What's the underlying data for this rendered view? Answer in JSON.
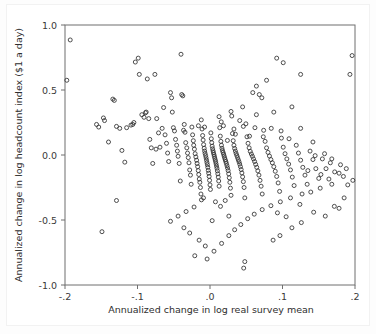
{
  "chart_data": {
    "type": "scatter",
    "title": "",
    "xlabel": "Annualized change in log real survey mean",
    "ylabel": "Annualized change in log headcount index ($1 a day)",
    "xlim": [
      -0.2,
      0.2
    ],
    "ylim": [
      -1.0,
      1.0
    ],
    "xticks": [
      -0.2,
      -0.1,
      0.0,
      0.1,
      0.2
    ],
    "xtick_labels": [
      "-.2",
      "-.1",
      ".0",
      ".1",
      ".2"
    ],
    "yticks": [
      -1.0,
      -0.5,
      0.0,
      0.5,
      1.0
    ],
    "ytick_labels": [
      "-1.0",
      "-0.5",
      "0.0",
      "0.5",
      "1.0"
    ],
    "grid": false,
    "legend": null,
    "marker": "open-circle",
    "marker_color": "#303030",
    "n_points": 283,
    "relationship": "negative",
    "points": [
      [
        -0.1928,
        0.885
      ],
      [
        -0.1975,
        0.575
      ],
      [
        -0.1565,
        0.235
      ],
      [
        -0.1535,
        0.215
      ],
      [
        -0.147,
        0.285
      ],
      [
        -0.1455,
        0.265
      ],
      [
        -0.14,
        0.1
      ],
      [
        -0.134,
        0.43
      ],
      [
        -0.132,
        0.42
      ],
      [
        -0.129,
        0.22
      ],
      [
        -0.1245,
        0.205
      ],
      [
        -0.1215,
        0.035
      ],
      [
        -0.1175,
        -0.055
      ],
      [
        -0.115,
        0.21
      ],
      [
        -0.109,
        0.23
      ],
      [
        -0.1065,
        0.235
      ],
      [
        -0.105,
        0.25
      ],
      [
        -0.103,
        0.715
      ],
      [
        -0.099,
        0.745
      ],
      [
        -0.0975,
        0.62
      ],
      [
        -0.094,
        0.31
      ],
      [
        -0.091,
        0.29
      ],
      [
        -0.089,
        0.325
      ],
      [
        -0.088,
        0.33
      ],
      [
        -0.0865,
        0.585
      ],
      [
        -0.0845,
        0.28
      ],
      [
        -0.083,
        0.12
      ],
      [
        -0.081,
        0.055
      ],
      [
        -0.079,
        -0.065
      ],
      [
        -0.076,
        0.62
      ],
      [
        -0.0745,
        0.045
      ],
      [
        -0.0735,
        0.28
      ],
      [
        -0.071,
        0.17
      ],
      [
        -0.069,
        0.06
      ],
      [
        -0.066,
        0.205
      ],
      [
        -0.064,
        0.365
      ],
      [
        -0.062,
        0.155
      ],
      [
        -0.06,
        0.09
      ],
      [
        -0.0585,
        0.015
      ],
      [
        -0.057,
        -0.05
      ],
      [
        -0.0545,
        0.48
      ],
      [
        -0.053,
        0.44
      ],
      [
        -0.052,
        0.33
      ],
      [
        -0.0505,
        0.21
      ],
      [
        -0.049,
        0.185
      ],
      [
        -0.0475,
        0.12
      ],
      [
        -0.046,
        0.075
      ],
      [
        -0.045,
        0.03
      ],
      [
        -0.044,
        -0.01
      ],
      [
        -0.0425,
        -0.065
      ],
      [
        -0.041,
        -0.2
      ],
      [
        -0.04,
        0.775
      ],
      [
        -0.039,
        0.465
      ],
      [
        -0.0375,
        0.455
      ],
      [
        -0.0365,
        0.19
      ],
      [
        -0.0355,
        0.235
      ],
      [
        -0.0345,
        0.175
      ],
      [
        -0.0335,
        0.095
      ],
      [
        -0.032,
        0.055
      ],
      [
        -0.031,
        0.015
      ],
      [
        -0.03,
        -0.02
      ],
      [
        -0.029,
        -0.06
      ],
      [
        -0.028,
        -0.115
      ],
      [
        -0.027,
        -0.155
      ],
      [
        -0.026,
        -0.225
      ],
      [
        -0.025,
        0.215
      ],
      [
        -0.024,
        0.155
      ],
      [
        -0.023,
        0.11
      ],
      [
        -0.0225,
        0.075
      ],
      [
        -0.0215,
        0.045
      ],
      [
        -0.0205,
        0.01
      ],
      [
        -0.0195,
        -0.015
      ],
      [
        -0.0185,
        -0.04
      ],
      [
        -0.0178,
        -0.065
      ],
      [
        -0.017,
        -0.09
      ],
      [
        -0.0162,
        -0.12
      ],
      [
        -0.0155,
        -0.15
      ],
      [
        -0.0148,
        -0.185
      ],
      [
        -0.014,
        -0.21
      ],
      [
        -0.0132,
        -0.25
      ],
      [
        -0.0125,
        -0.3
      ],
      [
        -0.0118,
        -0.345
      ],
      [
        -0.011,
        0.2
      ],
      [
        -0.0102,
        0.15
      ],
      [
        -0.0095,
        0.115
      ],
      [
        -0.0088,
        0.08
      ],
      [
        -0.008,
        0.052
      ],
      [
        -0.0074,
        0.03
      ],
      [
        -0.0068,
        0.012
      ],
      [
        -0.006,
        -0.005
      ],
      [
        -0.0054,
        -0.022
      ],
      [
        -0.0048,
        -0.04
      ],
      [
        -0.0042,
        -0.058
      ],
      [
        -0.0036,
        -0.075
      ],
      [
        -0.003,
        -0.095
      ],
      [
        -0.0024,
        -0.118
      ],
      [
        -0.0018,
        -0.14
      ],
      [
        -0.0012,
        -0.165
      ],
      [
        -0.0006,
        -0.195
      ],
      [
        0.0,
        -0.23
      ],
      [
        0.0006,
        -0.265
      ],
      [
        0.0012,
        0.17
      ],
      [
        0.0018,
        0.125
      ],
      [
        0.0024,
        0.095
      ],
      [
        0.003,
        0.068
      ],
      [
        0.0036,
        0.048
      ],
      [
        0.0042,
        0.032
      ],
      [
        0.0048,
        0.018
      ],
      [
        0.0054,
        0.004
      ],
      [
        0.006,
        -0.01
      ],
      [
        0.0066,
        -0.024
      ],
      [
        0.0072,
        -0.038
      ],
      [
        0.0078,
        -0.052
      ],
      [
        0.0084,
        -0.068
      ],
      [
        0.009,
        -0.085
      ],
      [
        0.0096,
        -0.102
      ],
      [
        0.0102,
        -0.122
      ],
      [
        0.0108,
        -0.145
      ],
      [
        0.0114,
        -0.17
      ],
      [
        0.012,
        -0.2
      ],
      [
        0.0126,
        -0.24
      ],
      [
        0.0134,
        0.21
      ],
      [
        0.0142,
        0.145
      ],
      [
        0.015,
        0.105
      ],
      [
        0.0158,
        0.075
      ],
      [
        0.0165,
        0.052
      ],
      [
        0.0172,
        0.035
      ],
      [
        0.018,
        0.02
      ],
      [
        0.0188,
        0.006
      ],
      [
        0.0195,
        -0.008
      ],
      [
        0.0202,
        -0.022
      ],
      [
        0.021,
        -0.036
      ],
      [
        0.0218,
        -0.05
      ],
      [
        0.0226,
        -0.065
      ],
      [
        0.0234,
        -0.082
      ],
      [
        0.0242,
        -0.1
      ],
      [
        0.025,
        -0.12
      ],
      [
        0.0258,
        -0.145
      ],
      [
        0.0266,
        -0.175
      ],
      [
        0.0274,
        -0.21
      ],
      [
        0.0282,
        -0.255
      ],
      [
        0.029,
        -0.31
      ],
      [
        0.03,
        0.3
      ],
      [
        0.031,
        0.165
      ],
      [
        0.032,
        0.11
      ],
      [
        0.033,
        0.075
      ],
      [
        0.034,
        0.05
      ],
      [
        0.035,
        0.03
      ],
      [
        0.036,
        0.012
      ],
      [
        0.037,
        -0.004
      ],
      [
        0.038,
        -0.02
      ],
      [
        0.039,
        -0.036
      ],
      [
        0.04,
        -0.052
      ],
      [
        0.041,
        -0.07
      ],
      [
        0.042,
        -0.09
      ],
      [
        0.043,
        -0.112
      ],
      [
        0.044,
        -0.138
      ],
      [
        0.045,
        -0.168
      ],
      [
        0.046,
        -0.205
      ],
      [
        0.047,
        -0.25
      ],
      [
        0.048,
        -0.33
      ],
      [
        0.0495,
        0.24
      ],
      [
        0.051,
        0.14
      ],
      [
        0.0525,
        0.09
      ],
      [
        0.054,
        0.055
      ],
      [
        0.0555,
        0.028
      ],
      [
        0.057,
        0.008
      ],
      [
        0.0585,
        -0.01
      ],
      [
        0.06,
        -0.03
      ],
      [
        0.0615,
        -0.05
      ],
      [
        0.063,
        -0.072
      ],
      [
        0.0645,
        -0.095
      ],
      [
        0.066,
        -0.122
      ],
      [
        0.0675,
        -0.155
      ],
      [
        0.069,
        -0.195
      ],
      [
        0.0705,
        -0.24
      ],
      [
        0.072,
        -0.3
      ],
      [
        0.074,
        0.19
      ],
      [
        0.076,
        0.105
      ],
      [
        0.078,
        0.055
      ],
      [
        0.08,
        0.02
      ],
      [
        0.082,
        -0.008
      ],
      [
        0.084,
        -0.035
      ],
      [
        0.086,
        -0.06
      ],
      [
        0.088,
        -0.09
      ],
      [
        0.09,
        -0.125
      ],
      [
        0.092,
        -0.165
      ],
      [
        0.094,
        -0.215
      ],
      [
        0.096,
        -0.28
      ],
      [
        0.0985,
        0.13
      ],
      [
        0.101,
        0.06
      ],
      [
        0.1035,
        0.01
      ],
      [
        0.106,
        -0.03
      ],
      [
        0.1085,
        -0.07
      ],
      [
        0.111,
        -0.115
      ],
      [
        0.1135,
        -0.17
      ],
      [
        0.116,
        -0.235
      ],
      [
        0.119,
        0.075
      ],
      [
        0.122,
        0.015
      ],
      [
        0.125,
        -0.04
      ],
      [
        0.128,
        -0.095
      ],
      [
        0.131,
        -0.155
      ],
      [
        0.134,
        -0.225
      ],
      [
        0.138,
        0.03
      ],
      [
        0.142,
        -0.035
      ],
      [
        0.146,
        -0.105
      ],
      [
        0.15,
        -0.18
      ],
      [
        0.155,
        -0.03
      ],
      [
        0.16,
        -0.105
      ],
      [
        0.166,
        -0.06
      ],
      [
        0.172,
        -0.13
      ],
      [
        0.18,
        -0.075
      ],
      [
        0.188,
        -0.105
      ],
      [
        0.193,
        0.62
      ],
      [
        0.196,
        0.765
      ],
      [
        0.125,
        0.62
      ],
      [
        0.092,
        0.745
      ],
      [
        0.101,
        0.71
      ],
      [
        0.078,
        0.575
      ],
      [
        0.064,
        0.53
      ],
      [
        0.059,
        0.48
      ],
      [
        0.068,
        0.465
      ],
      [
        0.0715,
        0.44
      ],
      [
        0.045,
        0.37
      ],
      [
        0.029,
        0.335
      ],
      [
        0.0125,
        0.295
      ],
      [
        -0.0075,
        0.215
      ],
      [
        0.0185,
        0.225
      ],
      [
        0.046,
        0.22
      ],
      [
        0.062,
        0.21
      ],
      [
        0.0845,
        0.205
      ],
      [
        0.098,
        0.185
      ],
      [
        0.035,
        0.16
      ],
      [
        0.0545,
        0.145
      ],
      [
        0.0735,
        0.14
      ],
      [
        0.109,
        0.125
      ],
      [
        0.024,
        0.112
      ],
      [
        0.142,
        0.1
      ],
      [
        -0.016,
        0.225
      ],
      [
        0.168,
        -0.225
      ],
      [
        0.152,
        -0.255
      ],
      [
        0.139,
        -0.285
      ],
      [
        0.127,
        -0.3
      ],
      [
        0.111,
        -0.33
      ],
      [
        0.097,
        -0.36
      ],
      [
        0.084,
        -0.39
      ],
      [
        0.072,
        -0.42
      ],
      [
        0.061,
        -0.455
      ],
      [
        0.052,
        -0.49
      ],
      [
        0.0425,
        -0.535
      ],
      [
        0.034,
        -0.575
      ],
      [
        0.026,
        -0.62
      ],
      [
        0.016,
        -0.68
      ],
      [
        0.0055,
        -0.74
      ],
      [
        -0.004,
        -0.8
      ],
      [
        0.048,
        -0.82
      ],
      [
        0.0465,
        -0.87
      ],
      [
        -0.022,
        -0.4
      ],
      [
        -0.033,
        -0.435
      ],
      [
        -0.044,
        -0.47
      ],
      [
        -0.0545,
        -0.51
      ],
      [
        -0.036,
        -0.56
      ],
      [
        -0.028,
        -0.6
      ],
      [
        -0.015,
        -0.655
      ],
      [
        -0.0065,
        -0.7
      ],
      [
        -0.129,
        -0.35
      ],
      [
        -0.149,
        -0.59
      ],
      [
        -0.021,
        -0.775
      ],
      [
        0.087,
        -0.655
      ],
      [
        0.0965,
        -0.62
      ],
      [
        0.113,
        -0.56
      ],
      [
        0.126,
        -0.52
      ],
      [
        0.105,
        -0.475
      ],
      [
        0.093,
        -0.445
      ],
      [
        0.143,
        -0.44
      ],
      [
        0.159,
        -0.47
      ],
      [
        0.185,
        -0.33
      ],
      [
        0.124,
        -0.38
      ],
      [
        0.1715,
        -0.395
      ],
      [
        0.178,
        -0.41
      ],
      [
        0.0145,
        -0.395
      ],
      [
        0.0075,
        -0.36
      ],
      [
        -0.009,
        -0.33
      ],
      [
        0.021,
        -0.35
      ],
      [
        0.197,
        -0.195
      ],
      [
        0.19,
        -0.23
      ],
      [
        0.184,
        -0.165
      ],
      [
        0.178,
        -0.14
      ],
      [
        0.164,
        -0.185
      ],
      [
        0.153,
        -0.15
      ],
      [
        0.135,
        -0.12
      ],
      [
        0.064,
        0.31
      ],
      [
        0.041,
        0.265
      ],
      [
        0.0155,
        0.255
      ],
      [
        -0.012,
        0.27
      ],
      [
        0.088,
        0.33
      ],
      [
        0.113,
        0.37
      ],
      [
        0.033,
        0.2
      ],
      [
        0.125,
        0.205
      ],
      [
        0.145,
        -0.005
      ],
      [
        0.158,
        0.01
      ],
      [
        0.168,
        -0.03
      ],
      [
        0.026,
        -0.47
      ],
      [
        0.003,
        -0.505
      ]
    ]
  },
  "axis": {
    "x_title": "Annualized change in log real survey mean",
    "y_title": "Annualized change in log headcount index ($1 a day)"
  }
}
